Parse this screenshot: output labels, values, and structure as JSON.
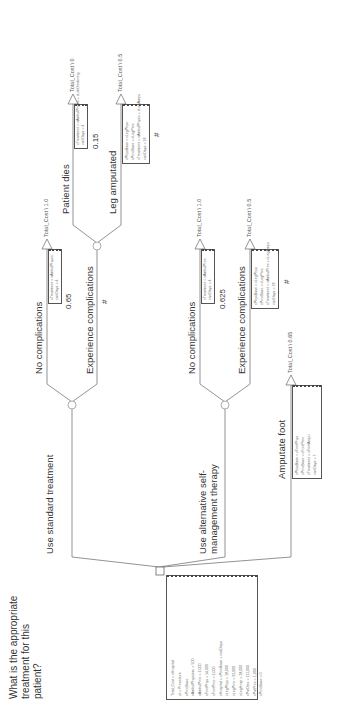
{
  "root": {
    "question": "What is the appropriate treatment for this patient?",
    "variables": [
      "Total_Cost = cHospital",
      "ut = Procedure",
      "cProcBase",
      "cAmbulPhysician = 500",
      "cAmbulProc = 2,000",
      "cFootPhys = 14,000",
      "cFootProc = 2,000",
      "cHospital = cProcBase + visitDays",
      "cLegPhys = 18,000",
      "cLegProc = 22,000",
      "cLegHosp = 18,000",
      "cPatDies = 111,000",
      "cPatProc = 1,000",
      "cProcBase = 0"
    ]
  },
  "branches": {
    "standard": {
      "label": "Use standard treatment",
      "no_comp": {
        "label": "No complications",
        "prob": "0.65",
        "payoff": "Total_Cost \\ 1.0",
        "vars": [
          "cTreatment = cAmbulPhysic",
          "visitDays = 4"
        ]
      },
      "comp": {
        "label": "Experience complications",
        "prob": "#",
        "dies": {
          "label": "Patient dies",
          "prob": "0.15",
          "payoff": "Total_Cost \\ 0",
          "vars": [
            "cTreatment = cAmbulPhysic + cLabDiedeving",
            "visitDays = 4"
          ]
        },
        "leg": {
          "label": "Leg amputated",
          "prob": "#",
          "payoff": "Total_Cost \\ 0.5",
          "vars": [
            "cPhysBase = cLegPhys",
            "cProcBase = cLegProc",
            "cTreatment = cAmbulPhysic + cLegAmpu",
            "visitDays = 18"
          ]
        }
      }
    },
    "alternative": {
      "label": "Use alternative self-management therapy",
      "no_comp": {
        "label": "No complications",
        "prob": "0.625",
        "payoff": "Total_Cost \\ 1.0",
        "vars": [
          "cTreatment = cAmbulProc",
          "visitDays = 4"
        ]
      },
      "comp": {
        "label": "Experience complications",
        "prob": "#",
        "payoff": "Total_Cost \\ 0.5",
        "vars": [
          "cPhysBase = cLegPhys",
          "cProcBase = cLegProc",
          "cTreatment = cAmbulProc + cLegAmpu",
          "visitDays = 18"
        ]
      }
    },
    "amputate": {
      "label": "Amputate foot",
      "payoff": "Total_Cost \\ 0.65",
      "vars": [
        "cPhysBase = cFootPhys",
        "cProcBase = cFootProc",
        "cTreatment = cFootAmpu",
        "visitDays = 7"
      ]
    }
  },
  "colors": {
    "line": "#666666",
    "text": "#333333",
    "box_border": "#555555"
  }
}
